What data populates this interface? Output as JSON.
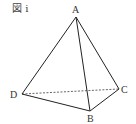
{
  "figure": {
    "title": "図 i",
    "vertices": {
      "A": {
        "label": "A",
        "x": 76,
        "y": 17
      },
      "B": {
        "label": "B",
        "x": 90,
        "y": 111
      },
      "C": {
        "label": "C",
        "x": 119,
        "y": 89
      },
      "D": {
        "label": "D",
        "x": 22,
        "y": 94
      }
    },
    "edges": [
      {
        "from": "A",
        "to": "B",
        "style": "solid"
      },
      {
        "from": "A",
        "to": "C",
        "style": "solid"
      },
      {
        "from": "A",
        "to": "D",
        "style": "solid"
      },
      {
        "from": "D",
        "to": "B",
        "style": "solid"
      },
      {
        "from": "B",
        "to": "C",
        "style": "solid"
      },
      {
        "from": "D",
        "to": "C",
        "style": "dashed"
      }
    ],
    "colors": {
      "line": "#222222",
      "label": "#333333"
    }
  }
}
